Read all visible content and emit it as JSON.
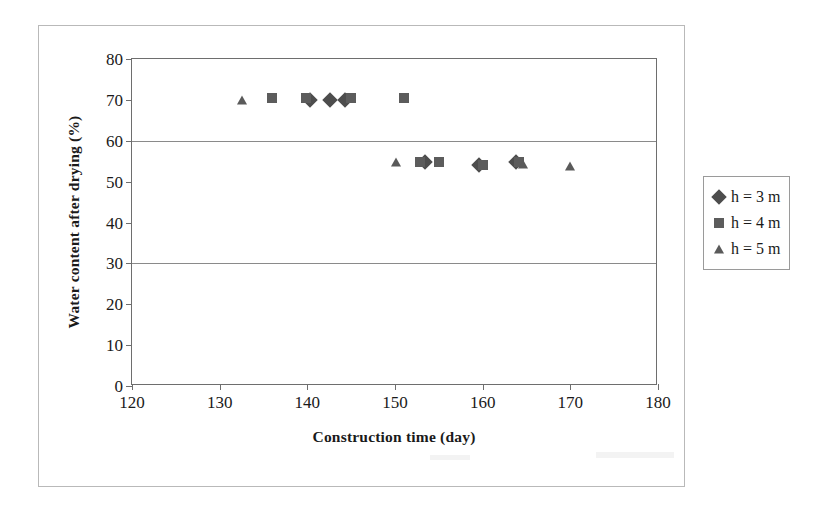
{
  "chart_data": {
    "type": "scatter",
    "title": "",
    "xlabel": "Construction time (day)",
    "ylabel": "Water content after drying (%)",
    "xlim": [
      120,
      180
    ],
    "ylim": [
      0,
      80
    ],
    "xticks": [
      120,
      130,
      140,
      150,
      160,
      170,
      180
    ],
    "yticks": [
      0,
      10,
      20,
      30,
      40,
      50,
      60,
      70,
      80
    ],
    "gridlines_y": [
      30,
      60
    ],
    "grid": "horizontal-major-only",
    "legend_position": "right",
    "series": [
      {
        "name": "h = 3 m",
        "marker": "diamond",
        "color": "#4d4d4d",
        "points": [
          {
            "x": 140.3,
            "y": 70
          },
          {
            "x": 142.6,
            "y": 70
          },
          {
            "x": 144.3,
            "y": 70
          },
          {
            "x": 153.4,
            "y": 54.8
          },
          {
            "x": 159.6,
            "y": 54
          },
          {
            "x": 163.8,
            "y": 54.8
          }
        ]
      },
      {
        "name": "h = 4 m",
        "marker": "square",
        "color": "#5c5c5c",
        "points": [
          {
            "x": 136.0,
            "y": 70.4
          },
          {
            "x": 139.9,
            "y": 70.4
          },
          {
            "x": 145.0,
            "y": 70.4
          },
          {
            "x": 151.0,
            "y": 70.4
          },
          {
            "x": 152.9,
            "y": 54.8
          },
          {
            "x": 155.0,
            "y": 54.8
          },
          {
            "x": 160.0,
            "y": 54.0
          },
          {
            "x": 164.2,
            "y": 54.8
          }
        ]
      },
      {
        "name": "h = 5 m",
        "marker": "triangle",
        "color": "#5a5a5a",
        "points": [
          {
            "x": 132.5,
            "y": 70
          },
          {
            "x": 150.1,
            "y": 54.8
          },
          {
            "x": 164.6,
            "y": 54.2
          },
          {
            "x": 170.0,
            "y": 53.9
          }
        ]
      }
    ]
  },
  "legend": {
    "items": [
      {
        "label": "h = 3 m",
        "marker": "diamond"
      },
      {
        "label": "h = 4 m",
        "marker": "square"
      },
      {
        "label": "h = 5 m",
        "marker": "triangle"
      }
    ]
  },
  "axes": {
    "x_title": "Construction time (day)",
    "y_title": "Water content after drying (%)",
    "x_tick_labels": [
      "120",
      "130",
      "140",
      "150",
      "160",
      "170",
      "180"
    ],
    "y_tick_labels": [
      "0",
      "10",
      "20",
      "30",
      "40",
      "50",
      "60",
      "70",
      "80"
    ]
  },
  "colors": {
    "series_3m": "#4d4d4d",
    "series_4m": "#5c5c5c",
    "series_5m": "#5a5a5a",
    "frame": "#6e6e6e",
    "grid": "#8a8a8a",
    "page_rule": "#b9b9b9"
  }
}
